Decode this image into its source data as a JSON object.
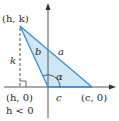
{
  "diagram": {
    "colors": {
      "triangle_fill": "#cfe6f5",
      "triangle_stroke": "#3a8fd1",
      "axis": "#555555",
      "dashed": "#555555",
      "text": "#2a2a2a"
    },
    "points": {
      "vertex_hk": "(h, k)",
      "foot_h0": "(h, 0)",
      "point_c0": "(c, 0)"
    },
    "labels": {
      "side_a": "a",
      "side_b": "b",
      "side_c": "c",
      "height_k": "k",
      "angle_alpha": "α",
      "condition": "h < 0"
    }
  }
}
